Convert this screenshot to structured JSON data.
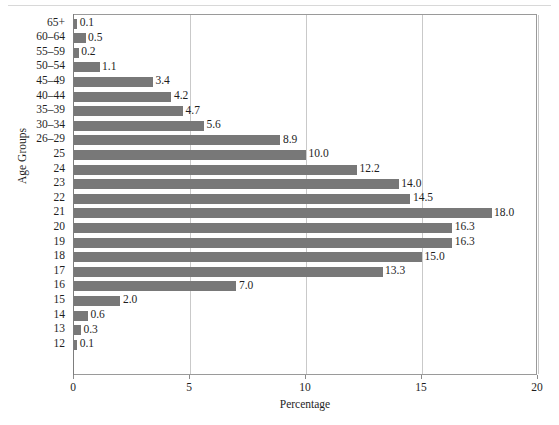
{
  "chart_data": {
    "type": "bar",
    "orientation": "horizontal",
    "title": "",
    "xlabel": "Percentage",
    "ylabel": "Age Groups",
    "xlim": [
      0,
      20
    ],
    "xticks": [
      "0",
      "5",
      "10",
      "15",
      "20"
    ],
    "grid": true,
    "legend": null,
    "bar_color": "#787878",
    "categories": [
      "65+",
      "60–64",
      "55–59",
      "50–54",
      "45–49",
      "40–44",
      "35–39",
      "30–34",
      "26–29",
      "25",
      "24",
      "23",
      "22",
      "21",
      "20",
      "19",
      "18",
      "17",
      "16",
      "15",
      "14",
      "13",
      "12"
    ],
    "values": [
      0.1,
      0.5,
      0.2,
      1.1,
      3.4,
      4.2,
      4.7,
      5.6,
      8.9,
      10.0,
      12.2,
      14.0,
      14.5,
      18.0,
      16.3,
      16.3,
      15.0,
      13.3,
      7.0,
      2.0,
      0.6,
      0.3,
      0.1
    ],
    "value_labels": [
      "0.1",
      "0.5",
      "0.2",
      "1.1",
      "3.4",
      "4.2",
      "4.7",
      "5.6",
      "8.9",
      "10.0",
      "12.2",
      "14.0",
      "14.5",
      "18.0",
      "16.3",
      "16.3",
      "15.0",
      "13.3",
      "7.0",
      "2.0",
      "0.6",
      "0.3",
      "0.1"
    ]
  }
}
